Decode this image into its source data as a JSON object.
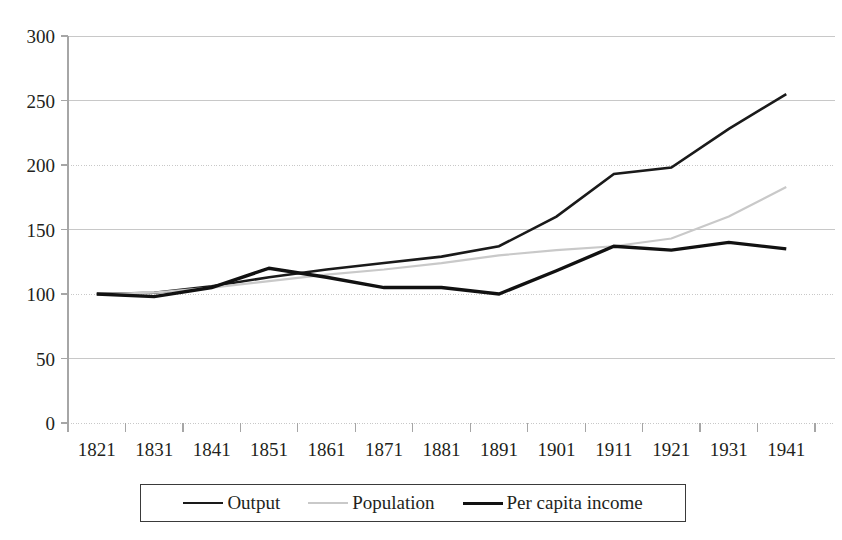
{
  "chart_data": {
    "type": "line",
    "title": "",
    "subtitle": "",
    "xlabel": "",
    "ylabel": "",
    "categories": [
      "1821",
      "1831",
      "1841",
      "1851",
      "1861",
      "1871",
      "1881",
      "1891",
      "1901",
      "1911",
      "1921",
      "1931",
      "1941"
    ],
    "ylim": [
      0,
      300
    ],
    "y_ticks": [
      0,
      50,
      100,
      150,
      200,
      250,
      300
    ],
    "grid": true,
    "grid_axis": "y",
    "legend_position": "bottom",
    "series": [
      {
        "name": "Output",
        "color": "#1a1a1a",
        "style": "solid",
        "width": 2.6,
        "values": [
          100,
          101,
          106,
          113,
          119,
          124,
          129,
          137,
          160,
          193,
          198,
          228,
          255
        ]
      },
      {
        "name": "Population",
        "color": "#c9c9c9",
        "style": "solid",
        "width": 2.2,
        "values": [
          100,
          101,
          105,
          110,
          115,
          119,
          124,
          130,
          134,
          137,
          143,
          160,
          183
        ]
      },
      {
        "name": "Per capita income",
        "color": "#111111",
        "style": "solid",
        "width": 3.4,
        "values": [
          100,
          98,
          105,
          120,
          113,
          105,
          105,
          100,
          118,
          137,
          134,
          140,
          135
        ]
      }
    ],
    "annotations": []
  },
  "axes": {
    "y_tick_labels": [
      "300",
      "250",
      "200",
      "150",
      "100",
      "50",
      "0"
    ],
    "x_tick_labels": [
      "1821",
      "1831",
      "1841",
      "1851",
      "1861",
      "1871",
      "1881",
      "1891",
      "1901",
      "1911",
      "1921",
      "1931",
      "1941"
    ]
  },
  "legend": {
    "entries": [
      {
        "label": "Output",
        "swatch": "output-line-swatch"
      },
      {
        "label": "Population",
        "swatch": "population-line-swatch"
      },
      {
        "label": "Per capita income",
        "swatch": "per-capita-income-line-swatch"
      }
    ]
  },
  "colors": {
    "output": "#1a1a1a",
    "population": "#c9c9c9",
    "per_capita_income": "#111111",
    "grid": "#c8c8c8",
    "axis": "#a6a6a6",
    "text": "#231f20"
  }
}
